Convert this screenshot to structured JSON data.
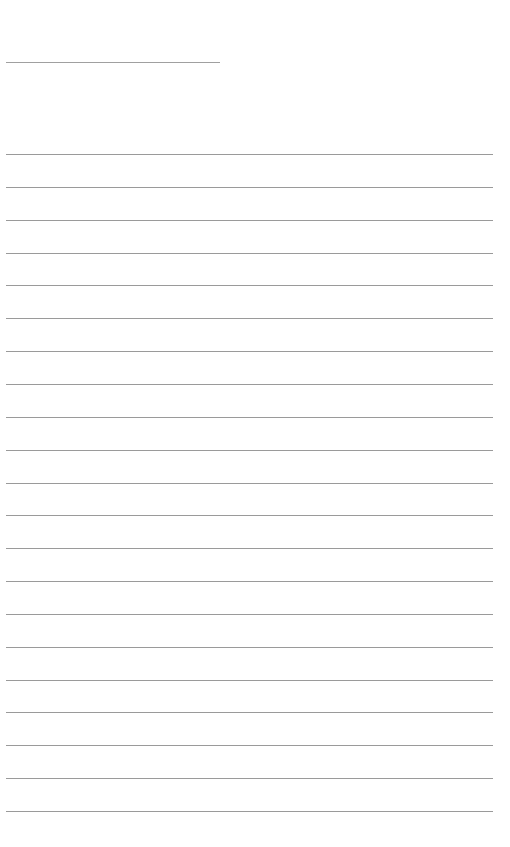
{
  "page": {
    "type": "blank lined notebook page",
    "title_line": {
      "top": 62,
      "left": 6,
      "width": 214
    },
    "ruled_lines": {
      "count": 21,
      "first_top": 154,
      "spacing": 32.85,
      "left": 6,
      "width": 487
    },
    "line_color": "#9a9a9a",
    "background": "#ffffff"
  }
}
